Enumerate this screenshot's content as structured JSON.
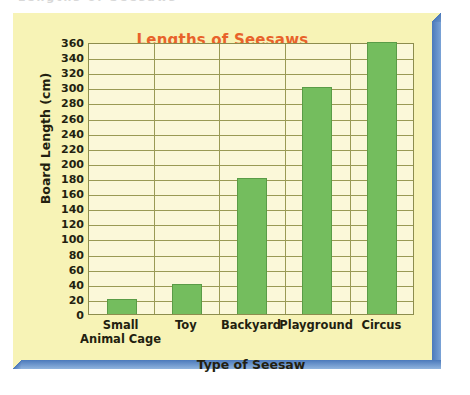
{
  "scan": {
    "ghost_text_top": "Lengths of Seesaws"
  },
  "chart_data": {
    "type": "bar",
    "title": "Lengths of Seesaws",
    "xlabel": "Type of Seesaw",
    "ylabel": "Board Length (cm)",
    "categories": [
      "Small Animal Cage",
      "Toy",
      "Backyard",
      "Playground",
      "Circus"
    ],
    "category_lines": [
      [
        "Small",
        "Animal Cage"
      ],
      [
        "Toy"
      ],
      [
        "Backyard"
      ],
      [
        "Playground"
      ],
      [
        "Circus"
      ]
    ],
    "values": [
      20,
      40,
      180,
      300,
      360
    ],
    "ylim": [
      0,
      360
    ],
    "ytick_step": 20,
    "yticks": [
      360,
      340,
      320,
      300,
      280,
      260,
      240,
      220,
      200,
      180,
      160,
      140,
      120,
      100,
      80,
      60,
      40,
      20,
      0
    ],
    "grid": true,
    "legend": "none",
    "colors": {
      "bar": "#74bd5e",
      "bar_edge": "#5a9c47",
      "title": "#e8622a",
      "plot_background": "#fbf8d9",
      "card_background": "#f7f3b6",
      "gridline": "#9a9a55",
      "axis_text": "#231f10",
      "shadow": "#4b79bb"
    }
  }
}
